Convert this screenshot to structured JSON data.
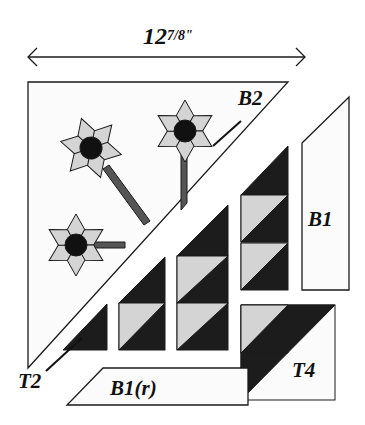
{
  "dimension": {
    "whole": "12",
    "fraction": "7/8",
    "fraction_num": "7",
    "fraction_den": "8",
    "unit": "\""
  },
  "labels": {
    "b2": "B2",
    "b1": "B1",
    "b1r": "B1(r)",
    "t2": "T2",
    "t4": "T4"
  },
  "colors": {
    "outline": "#1a1a1a",
    "light_fabric": "#d4d4d4",
    "dark_fabric": "#1c1c1c",
    "background_fabric": "#fbfbfb",
    "flower_center": "#111111",
    "stem": "#555555"
  },
  "pieces": [
    {
      "id": "flower-triangle",
      "label": "B2",
      "description": "Large half-square triangle with three six-petal flowers and stems"
    },
    {
      "id": "hst-column-right",
      "label": "",
      "description": "Column of two half-square triangle units topped with a dark triangle"
    },
    {
      "id": "hst-column-middle",
      "label": "",
      "description": "Column of two half-square triangle units topped with a dark triangle"
    },
    {
      "id": "hst-column-left",
      "label": "",
      "description": "One half-square triangle unit topped with a dark triangle"
    },
    {
      "id": "small-dark-triangle",
      "label": "T2",
      "description": "Single dark triangle"
    },
    {
      "id": "border-strip-right",
      "label": "B1",
      "description": "Vertical border strip with angled top"
    },
    {
      "id": "border-strip-bottom",
      "label": "B1(r)",
      "description": "Horizontal border strip with angled left end (reversed)"
    },
    {
      "id": "corner-square",
      "label": "T4",
      "description": "Corner square of triangle units"
    }
  ]
}
